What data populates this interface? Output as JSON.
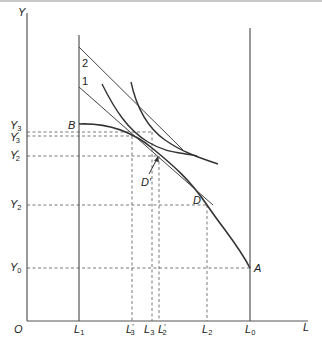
{
  "figure": {
    "axes": {
      "y_label": "Y",
      "x_label": "L",
      "origin_label": "O"
    },
    "y_ticks": [
      {
        "base": "Y",
        "sub": "3",
        "prime": "",
        "y": 132
      },
      {
        "base": "Y",
        "sub": "3",
        "prime": "′",
        "y": 136
      },
      {
        "base": "Y",
        "sub": "2",
        "prime": "′",
        "y": 156
      },
      {
        "base": "Y",
        "sub": "2",
        "prime": "",
        "y": 205
      },
      {
        "base": "Y",
        "sub": "0",
        "prime": "",
        "y": 268
      }
    ],
    "x_ticks": [
      {
        "base": "L",
        "sub": "1",
        "prime": "",
        "x": 79
      },
      {
        "base": "L",
        "sub": "3",
        "prime": "′",
        "x": 132
      },
      {
        "base": "L",
        "sub": "3",
        "prime": "",
        "x": 152
      },
      {
        "base": "L",
        "sub": "2",
        "prime": "′",
        "x": 159
      },
      {
        "base": "L",
        "sub": "2",
        "prime": "",
        "x": 207
      },
      {
        "base": "L",
        "sub": "0",
        "prime": "",
        "x": 250
      }
    ],
    "point_labels": {
      "B": "B",
      "A": "A",
      "D": "D",
      "D_prime": "D′"
    },
    "line_labels": {
      "line1": "1",
      "line2": "2"
    },
    "colors": {
      "ink": "#333333",
      "dashes": "#555555",
      "top_rule": "#c8c8c8"
    }
  }
}
